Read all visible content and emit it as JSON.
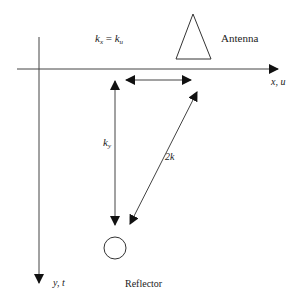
{
  "diagram": {
    "labels": {
      "kx_base": "k",
      "kx_sub": "x",
      "equals": " = ",
      "ku_base": "k",
      "ku_sub": "u",
      "antenna": "Antenna",
      "x_axis": "x, u",
      "y_axis": "y, t",
      "ky_base": "k",
      "ky_sub": "y",
      "two_k": "2k",
      "reflector": "Reflector"
    },
    "colors": {
      "line": "#333333",
      "text": "#222222"
    }
  }
}
